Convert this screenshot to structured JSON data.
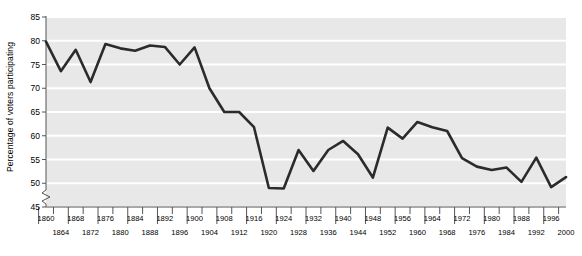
{
  "chart_data": {
    "type": "line",
    "title": "",
    "xlabel": "",
    "ylabel": "Percentage of voters participating",
    "ylim": [
      45,
      85
    ],
    "yticks": [
      45,
      50,
      55,
      60,
      65,
      70,
      75,
      80,
      85
    ],
    "ytick_labels": [
      "45",
      "50",
      "55",
      "60",
      "65",
      "70",
      "75",
      "80",
      "85"
    ],
    "xlim": [
      1860,
      2000
    ],
    "grid": "horizontal",
    "legend": "none",
    "axis_break": true,
    "line_color": "#2b2b2b",
    "plot_background": "#e8e8e8",
    "gridline_color": "#ffffff",
    "x": [
      1860,
      1864,
      1868,
      1872,
      1876,
      1880,
      1884,
      1888,
      1892,
      1896,
      1900,
      1904,
      1908,
      1912,
      1916,
      1920,
      1924,
      1928,
      1932,
      1936,
      1940,
      1944,
      1948,
      1952,
      1956,
      1960,
      1964,
      1968,
      1972,
      1976,
      1980,
      1984,
      1988,
      1992,
      1996,
      2000
    ],
    "values": [
      79.8,
      73.6,
      78.1,
      71.3,
      79.3,
      78.4,
      77.9,
      79.0,
      78.7,
      75.0,
      78.6,
      70.0,
      65.0,
      65.0,
      61.8,
      49.0,
      48.9,
      57.0,
      52.6,
      57.0,
      58.9,
      56.1,
      51.2,
      61.7,
      59.4,
      62.9,
      61.8,
      61.0,
      55.3,
      53.5,
      52.8,
      53.3,
      50.3,
      55.4,
      49.2,
      51.3
    ],
    "xtick_labels_top": [
      "1860",
      "1868",
      "1876",
      "1884",
      "1892",
      "1900",
      "1908",
      "1916",
      "1924",
      "1932",
      "1940",
      "1948",
      "1956",
      "1964",
      "1972",
      "1980",
      "1988",
      "1996"
    ],
    "xtick_labels_bottom": [
      "1864",
      "1872",
      "1880",
      "1888",
      "1896",
      "1904",
      "1912",
      "1920",
      "1928",
      "1936",
      "1944",
      "1952",
      "1960",
      "1968",
      "1976",
      "1984",
      "1992",
      "2000"
    ]
  }
}
